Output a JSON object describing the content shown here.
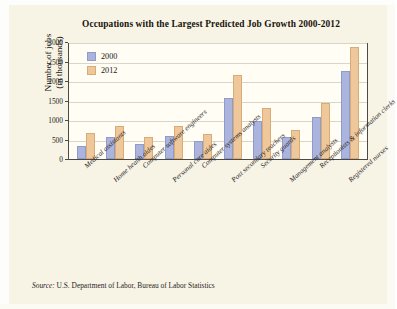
{
  "figure": {
    "title": "Occupations with the Largest Predicted Job Growth 2000-2012",
    "source_prefix": "Source:",
    "source_text": " U.S. Department of Labor, Bureau of Labor Statistics"
  },
  "legend": {
    "items": [
      {
        "label": "2000",
        "color": "#aab4dd"
      },
      {
        "label": "2012",
        "color": "#eec89a"
      }
    ]
  },
  "axes": {
    "ylabel_line1": "Number of jobs",
    "ylabel_line2": "(in thousands)",
    "yticks": [
      "3000",
      "2500",
      "2000",
      "1500",
      "1000",
      "500",
      "0"
    ]
  },
  "chart_data": {
    "type": "bar",
    "title": "Occupations with the Largest Predicted Job Growth 2000-2012",
    "xlabel": "",
    "ylabel": "Number of jobs (in thousands)",
    "ylim": [
      0,
      3000
    ],
    "ytick_step": 500,
    "grid": true,
    "legend_position": "top-left inside plot",
    "categories": [
      "Medical assistants",
      "Home health aides",
      "Computer software engineers",
      "Personal care aides",
      "Computer systems analysts",
      "Post secondary teachers",
      "Security guards",
      "Management analysts",
      "Receptionists & information clerks",
      "Registered nurses"
    ],
    "series": [
      {
        "name": "2000",
        "color": "#aab4dd",
        "values": [
          330,
          580,
          390,
          610,
          470,
          1580,
          1000,
          580,
          1100,
          2300
        ]
      },
      {
        "name": "2012",
        "color": "#eec89a",
        "values": [
          690,
          860,
          570,
          860,
          650,
          2190,
          1320,
          760,
          1450,
          2910
        ]
      }
    ]
  }
}
